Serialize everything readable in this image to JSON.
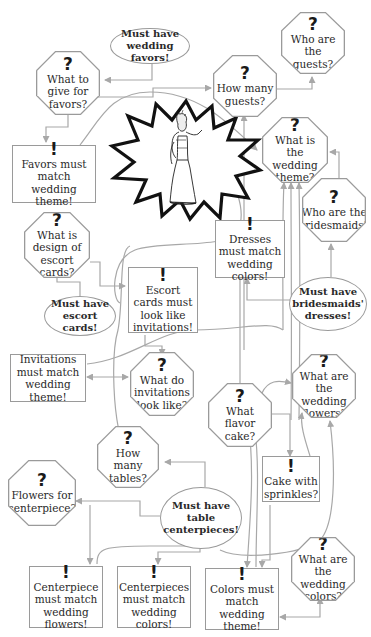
{
  "colors": {
    "background": "#ffffff",
    "line": "#a8a8a8",
    "border": "#9a9a9a",
    "text": "#2a2a2a",
    "starburst": "#111111"
  },
  "symbols": {
    "question": "?",
    "exclaim": "!"
  },
  "center_image": {
    "icon": "woman-in-victorian-dress-figure-icon",
    "shape": "starburst"
  },
  "nodes": {
    "must_favors": {
      "type": "ellipse",
      "label": "Must have wedding favors!"
    },
    "what_give_favors": {
      "type": "question",
      "label": "What to give for favors?"
    },
    "how_many_guests": {
      "type": "question",
      "label": "How many guests?"
    },
    "who_guests": {
      "type": "question",
      "label": "Who are the guests?"
    },
    "favors_match_theme": {
      "type": "fact",
      "label": "Favors must match wedding theme!"
    },
    "wedding_theme": {
      "type": "question",
      "label": "What is the wedding theme?"
    },
    "who_bridesmaids": {
      "type": "question",
      "label": "Who are the bridesmaids?"
    },
    "design_escort": {
      "type": "question",
      "label": "What is design of escort cards?"
    },
    "dresses_colors": {
      "type": "fact",
      "label": "Dresses must match wedding colors!"
    },
    "escort_invites": {
      "type": "fact",
      "label": "Escort cards must look like invitations!"
    },
    "must_escort": {
      "type": "ellipse",
      "label": "Must have escort cards!"
    },
    "must_dresses": {
      "type": "ellipse",
      "label": "Must have bridesmaids' dresses!"
    },
    "invites_theme": {
      "type": "plain",
      "label": "Invitations must match wedding theme!"
    },
    "invites_look": {
      "type": "question",
      "label": "What do invitations look like?"
    },
    "flavor_cake": {
      "type": "question",
      "label": "What flavor cake?"
    },
    "wedding_flowers": {
      "type": "question",
      "label": "What are the wedding flowers?"
    },
    "how_many_tables": {
      "type": "question",
      "label": "How many tables?"
    },
    "cake_sprinkles": {
      "type": "fact",
      "label": "Cake with sprinkles?"
    },
    "flowers_center": {
      "type": "question",
      "label": "Flowers for centerpiece?"
    },
    "must_centerpieces": {
      "type": "ellipse",
      "label": "Must have table centerpieces!"
    },
    "wedding_colors": {
      "type": "question",
      "label": "What are the wedding colors?"
    },
    "center_flowers": {
      "type": "fact",
      "label": "Centerpiece must match wedding flowers!"
    },
    "center_colors": {
      "type": "fact",
      "label": "Centerpieces must match wedding colors!"
    },
    "colors_theme": {
      "type": "fact",
      "label": "Colors must match wedding theme!"
    }
  }
}
